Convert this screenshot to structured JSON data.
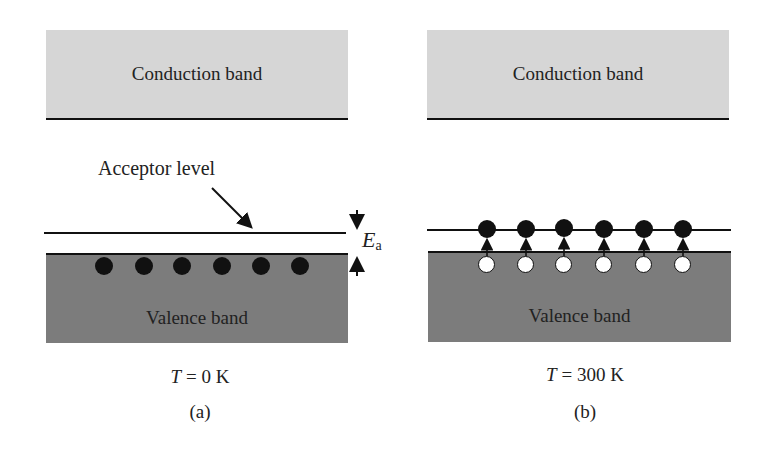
{
  "panels": {
    "a": {
      "conduction_label": "Conduction band",
      "valence_label": "Valence band",
      "acceptor_label": "Acceptor level",
      "energy_label_main": "E",
      "energy_label_sub": "a",
      "temperature_var": "T",
      "temperature_value": " = 0 K",
      "caption": "(a)",
      "electron_count": 6
    },
    "b": {
      "conduction_label": "Conduction band",
      "valence_label": "Valence band",
      "temperature_var": "T",
      "temperature_value": " = 300 K",
      "caption": "(b)",
      "electron_count": 6,
      "hole_count": 6
    }
  }
}
